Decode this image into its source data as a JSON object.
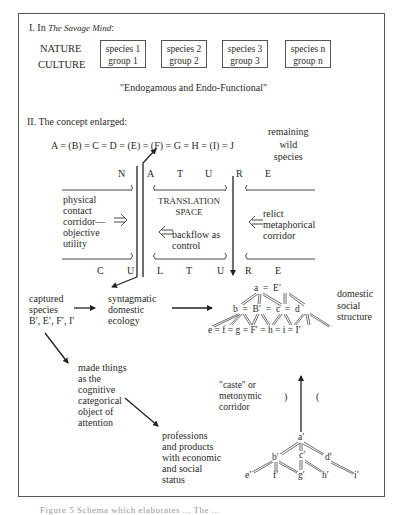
{
  "section1": {
    "heading_prefix": "I. In ",
    "heading_italic": "The Savage Mind",
    "heading_suffix": ":",
    "row_labels": [
      "NATURE",
      "CULTURE"
    ],
    "boxes": [
      {
        "top": "species 1",
        "bottom": "group 1"
      },
      {
        "top": "species 2",
        "bottom": "group 2"
      },
      {
        "top": "species 3",
        "bottom": "group 3"
      },
      {
        "top": "species n",
        "bottom": "group n"
      }
    ],
    "subtitle": "\"Endogamous and Endo-Functional\""
  },
  "section2": {
    "heading": "II. The concept enlarged:",
    "equation": "A = (B) = C = D = (E) = (F) = G = H = (I) = J",
    "remaining": "remaining\nwild\nspecies",
    "nature_letters": [
      "N",
      "A",
      "T",
      "U",
      "R",
      "E"
    ],
    "culture_letters": [
      "C",
      "U",
      "L",
      "T",
      "U",
      "R",
      "E"
    ],
    "physical": "physical\ncontact\ncorridor—\nobjective\nutility",
    "translation": "TRANSLATION\nSPACE",
    "backflow": "backflow as\ncontrol",
    "relict": "relict\nmetaphorical\ncorridor",
    "captured": "captured\nspecies\nB′, E′, F′, I′",
    "syntagmatic": "syntagmatic\ndomestic\necology",
    "domestic_social": "domestic\nsocial\nstructure",
    "made_things": "made things\nas the\ncognitive\ncategorical\nobject of\nattention",
    "professions": "professions\nand products\nwith economic\nand social\nstatus",
    "caste": "\"caste\" or\nmetonymic\ncorridor",
    "paren_close": ")",
    "paren_open": "(",
    "tree1": {
      "row1": "a  =  E′",
      "row2": "b  =  B′  =  c  =  d",
      "row3": "e = f = g = F′ = h = i = I′"
    },
    "tree2": {
      "nodes": [
        "a′",
        "b′",
        "c′",
        "d′",
        "e′",
        "f′",
        "g′",
        "h′",
        "i′"
      ]
    }
  },
  "caption": "Figure 5  Schema which elaborates ...  The ..."
}
